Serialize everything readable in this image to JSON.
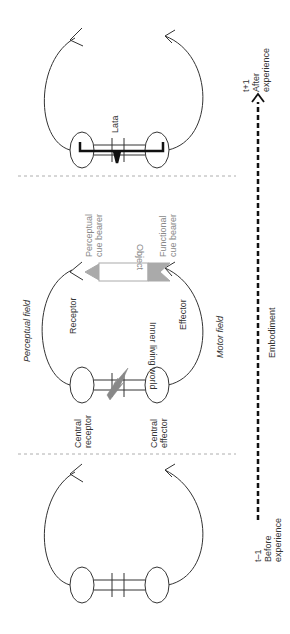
{
  "diagram": {
    "stages": [
      {
        "id": "after",
        "time_label": "t+1",
        "caption": "After experience",
        "link_label": "Lata"
      },
      {
        "id": "middle",
        "caption": "",
        "field_top": "Perceptual field",
        "field_bottom": "Motor field"
      },
      {
        "id": "before",
        "time_label": "t-1",
        "caption": "Before experience"
      }
    ],
    "labels": {
      "perceptual_field": "Perceptual field",
      "motor_field": "Motor field",
      "receptor": "Receptor",
      "effector": "Effector",
      "inner_world": "Inner living world",
      "object": "Object",
      "perceptual_cue_1": "Perceptual",
      "perceptual_cue_2": "cue bearer",
      "functional_cue_1": "Functional",
      "functional_cue_2": "cue bearer",
      "central_receptor_1": "Central",
      "central_receptor_2": "receptor",
      "central_effector_1": "Central",
      "central_effector_2": "effector",
      "lata": "Lata",
      "embodiment": "Embodiment",
      "t_plus_1": "t+1",
      "after_1": "After",
      "after_2": "experience",
      "t_minus_1": "t–1",
      "before_1": "Before",
      "before_2": "experience"
    },
    "colors": {
      "line": "#333333",
      "cue_fill": "#aaaaaa",
      "divider": "#999999",
      "lightning": "#888888"
    }
  }
}
